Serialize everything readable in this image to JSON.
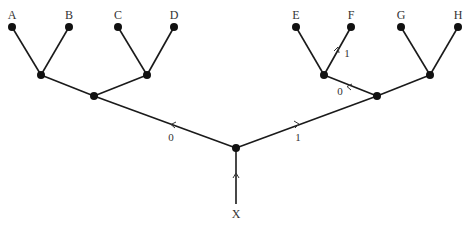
{
  "diagram": {
    "type": "binary-tree",
    "root_label": "X",
    "leaves": [
      {
        "label": "A",
        "x": 12,
        "y": 27
      },
      {
        "label": "B",
        "x": 69,
        "y": 27
      },
      {
        "label": "C",
        "x": 118,
        "y": 27
      },
      {
        "label": "D",
        "x": 174,
        "y": 27
      },
      {
        "label": "E",
        "x": 296,
        "y": 27
      },
      {
        "label": "F",
        "x": 351,
        "y": 27
      },
      {
        "label": "G",
        "x": 401,
        "y": 27
      },
      {
        "label": "H",
        "x": 458,
        "y": 27
      }
    ],
    "edge_labels": [
      {
        "text": "0",
        "x": 171,
        "y": 141,
        "desc": "root to left subtree"
      },
      {
        "text": "1",
        "x": 298,
        "y": 141,
        "desc": "root to right subtree"
      },
      {
        "text": "0",
        "x": 340,
        "y": 95,
        "desc": "right subtree to EF parent"
      },
      {
        "text": "1",
        "x": 347,
        "y": 57,
        "desc": "EF parent to F"
      }
    ],
    "colors": {
      "edge": "#1a1a1a",
      "node": "#111111",
      "text": "#333333",
      "background": "#ffffff"
    }
  }
}
